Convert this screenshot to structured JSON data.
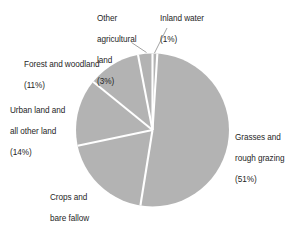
{
  "chart_data": {
    "type": "pie",
    "title": "",
    "subtitle": "",
    "xlabel": "",
    "ylabel": "",
    "legend_position": "none",
    "grid": false,
    "units": "percent",
    "start_angle_deg": 0,
    "direction": "clockwise",
    "slice_separator_color": "#ffffff",
    "slice_fill_color": "#b3b3b3",
    "categories": [
      "Inland water",
      "Grasses and rough grazing",
      "Crops and bare fallow",
      "Urban land and all other land",
      "Forest and woodland",
      "Other agricultural land"
    ],
    "values": [
      1,
      51,
      19,
      14,
      11,
      3
    ],
    "slices": [
      {
        "name": "inland-water",
        "label_line1": "Inland water",
        "label_line2": "",
        "percent_text": "(1%)",
        "value": 1,
        "leader": true
      },
      {
        "name": "grasses-and-rough-grazing",
        "label_line1": "Grasses and",
        "label_line2": "rough grazing",
        "percent_text": "(51%)",
        "value": 51,
        "leader": false
      },
      {
        "name": "crops-and-bare-fallow",
        "label_line1": "Crops and",
        "label_line2": "bare fallow",
        "percent_text": "(19%)",
        "value": 19,
        "leader": false
      },
      {
        "name": "urban-land-and-all-other-land",
        "label_line1": "Urban land and",
        "label_line2": "all other land",
        "percent_text": "(14%)",
        "value": 14,
        "leader": false
      },
      {
        "name": "forest-and-woodland",
        "label_line1": "Forest and woodland",
        "label_line2": "",
        "percent_text": "(11%)",
        "value": 11,
        "leader": false
      },
      {
        "name": "other-agricultural-land",
        "label_line1": "Other",
        "label_line2": "agricultural",
        "label_line3": "land",
        "percent_text": "(3%)",
        "value": 3,
        "leader": true
      }
    ]
  },
  "labels": {
    "other_agricultural": {
      "line1": "Other",
      "line2": "agricultural",
      "line3": "land",
      "pct": "(3%)"
    },
    "inland_water": {
      "line1": "Inland water",
      "pct": "(1%)"
    },
    "forest": {
      "line1": "Forest and woodland",
      "pct": "(11%)"
    },
    "urban": {
      "line1": "Urban land and",
      "line2": "all other land",
      "pct": "(14%)"
    },
    "crops": {
      "line1": "Crops and",
      "line2": "bare fallow",
      "pct": "(19%)"
    },
    "grasses": {
      "line1": "Grasses and",
      "line2": "rough grazing",
      "pct": "(51%)"
    }
  },
  "colors": {
    "fill": "#b3b3b3",
    "separator": "#ffffff",
    "leader_line": "#8c8c8c",
    "text": "#262626",
    "background": "#ffffff"
  }
}
